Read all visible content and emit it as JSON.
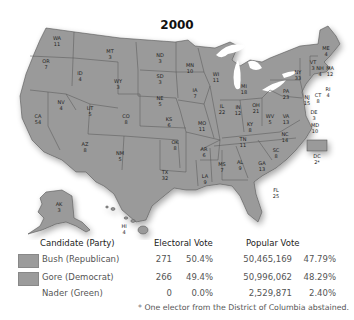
{
  "title": "2000",
  "colors": {
    "state_fill": "#9a9a9a",
    "state_border": "#555555",
    "water": "#ffffff",
    "background": "#ffffff"
  },
  "states": [
    {
      "abbr": "WA",
      "ev": "11"
    },
    {
      "abbr": "OR",
      "ev": "7"
    },
    {
      "abbr": "CA",
      "ev": "54"
    },
    {
      "abbr": "ID",
      "ev": "4"
    },
    {
      "abbr": "NV",
      "ev": "4"
    },
    {
      "abbr": "MT",
      "ev": "3"
    },
    {
      "abbr": "WY",
      "ev": "3"
    },
    {
      "abbr": "UT",
      "ev": "5"
    },
    {
      "abbr": "AZ",
      "ev": "8"
    },
    {
      "abbr": "CO",
      "ev": "8"
    },
    {
      "abbr": "NM",
      "ev": "5"
    },
    {
      "abbr": "ND",
      "ev": "3"
    },
    {
      "abbr": "SD",
      "ev": "3"
    },
    {
      "abbr": "NE",
      "ev": "5"
    },
    {
      "abbr": "KS",
      "ev": "6"
    },
    {
      "abbr": "OK",
      "ev": "8"
    },
    {
      "abbr": "TX",
      "ev": "32"
    },
    {
      "abbr": "MN",
      "ev": "10"
    },
    {
      "abbr": "IA",
      "ev": "7"
    },
    {
      "abbr": "MO",
      "ev": "11"
    },
    {
      "abbr": "AR",
      "ev": "6"
    },
    {
      "abbr": "LA",
      "ev": "9"
    },
    {
      "abbr": "WI",
      "ev": "11"
    },
    {
      "abbr": "IL",
      "ev": "22"
    },
    {
      "abbr": "MI",
      "ev": "18"
    },
    {
      "abbr": "IN",
      "ev": "12"
    },
    {
      "abbr": "OH",
      "ev": "21"
    },
    {
      "abbr": "KY",
      "ev": "8"
    },
    {
      "abbr": "TN",
      "ev": "11"
    },
    {
      "abbr": "MS",
      "ev": "7"
    },
    {
      "abbr": "AL",
      "ev": "9"
    },
    {
      "abbr": "GA",
      "ev": "13"
    },
    {
      "abbr": "FL",
      "ev": "25"
    },
    {
      "abbr": "SC",
      "ev": "8"
    },
    {
      "abbr": "NC",
      "ev": "14"
    },
    {
      "abbr": "VA",
      "ev": "13"
    },
    {
      "abbr": "WV",
      "ev": "5"
    },
    {
      "abbr": "PA",
      "ev": "23"
    },
    {
      "abbr": "NY",
      "ev": "33"
    },
    {
      "abbr": "NJ",
      "ev": "15"
    },
    {
      "abbr": "DE",
      "ev": "3"
    },
    {
      "abbr": "MD",
      "ev": "10"
    },
    {
      "abbr": "DC",
      "ev": "2*"
    },
    {
      "abbr": "CT",
      "ev": "8"
    },
    {
      "abbr": "RI",
      "ev": "4"
    },
    {
      "abbr": "MA",
      "ev": "12"
    },
    {
      "abbr": "VT",
      "ev": "3"
    },
    {
      "abbr": "NH",
      "ev": "4"
    },
    {
      "abbr": "ME",
      "ev": "4"
    },
    {
      "abbr": "AK",
      "ev": "3"
    },
    {
      "abbr": "HI",
      "ev": "4"
    }
  ],
  "legend": {
    "headers": {
      "candidate": "Candidate (Party)",
      "electoral": "Electoral Vote",
      "popular": "Popular Vote"
    },
    "rows": [
      {
        "candidate": "Bush (Republican)",
        "ev": "271",
        "ev_pct": "50.4%",
        "pv": "50,465,169",
        "pv_pct": "47.79%",
        "swatch": true
      },
      {
        "candidate": "Gore (Democrat)",
        "ev": "266",
        "ev_pct": "49.4%",
        "pv": "50,996,062",
        "pv_pct": "48.29%",
        "swatch": true
      },
      {
        "candidate": "Nader (Green)",
        "ev": "0",
        "ev_pct": "0.0%",
        "pv": "2,529,871",
        "pv_pct": "2.40%",
        "swatch": false
      }
    ],
    "footnote": "* One elector from the District of Columbia abstained."
  }
}
